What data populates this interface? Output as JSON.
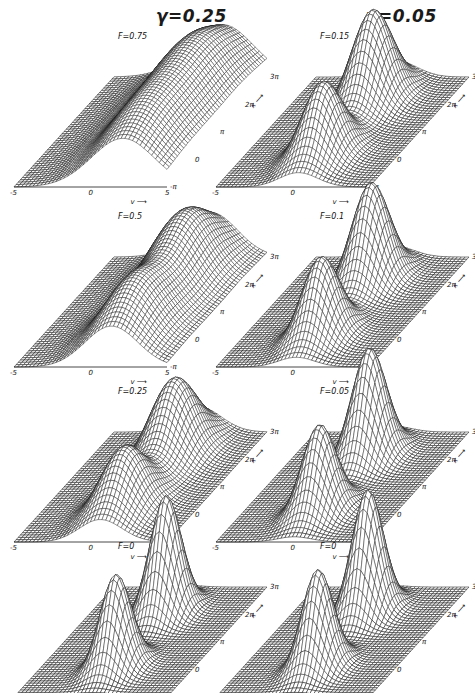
{
  "figure": {
    "columns": [
      {
        "title": "γ=0.25"
      },
      {
        "title": "γ=0.05"
      }
    ],
    "panels": [
      {
        "col": 0,
        "row": 0,
        "label": "F=0.75"
      },
      {
        "col": 1,
        "row": 0,
        "label": "F=0.15"
      },
      {
        "col": 0,
        "row": 1,
        "label": "F=0.5"
      },
      {
        "col": 1,
        "row": 1,
        "label": "F=0.1"
      },
      {
        "col": 0,
        "row": 2,
        "label": "F=0.25"
      },
      {
        "col": 1,
        "row": 2,
        "label": "F=0.05"
      },
      {
        "col": 0,
        "row": 3,
        "label": "F=0"
      },
      {
        "col": 1,
        "row": 3,
        "label": "F=0"
      }
    ],
    "axes": {
      "v_ticks": [
        "-5",
        "0",
        "5"
      ],
      "v_label": "v ⟶",
      "x_ticks": [
        "-π",
        "0",
        "π",
        "2π",
        "3π"
      ],
      "x_label": "x ⟶"
    }
  },
  "chart_data": {
    "type": "surface",
    "title": "",
    "layout": "4 rows × 2 columns of 3D wireframe surface plots",
    "columns": [
      "γ=0.25",
      "γ=0.05"
    ],
    "xlabel": "v",
    "ylabel": "x",
    "xlim": [
      -5,
      5
    ],
    "ylim": [
      "-π",
      "3π"
    ],
    "x_ticks": [
      "-5",
      "0",
      "5"
    ],
    "y_ticks": [
      "-π",
      "0",
      "π",
      "2π",
      "3π"
    ],
    "panels": [
      {
        "gamma": 0.25,
        "F": 0.75,
        "description": "broad diagonal ridge, nearly flat, shifted toward v>0"
      },
      {
        "gamma": 0.05,
        "F": 0.15,
        "description": "diagonal ridge with two moderate humps"
      },
      {
        "gamma": 0.25,
        "F": 0.5,
        "description": "wide undulating ridge with two shallow humps"
      },
      {
        "gamma": 0.05,
        "F": 0.1,
        "description": "two distinct peaks separated by 2π in x"
      },
      {
        "gamma": 0.25,
        "F": 0.25,
        "description": "two peaks along x, connected by low ridge"
      },
      {
        "gamma": 0.05,
        "F": 0.05,
        "description": "two tall peaks along x"
      },
      {
        "gamma": 0.25,
        "F": 0,
        "description": "two tall Gaussian-like peaks at v≈0, x=0 and x=2π"
      },
      {
        "gamma": 0.05,
        "F": 0,
        "description": "two tall Gaussian-like peaks at v≈0, x=0 and x=2π"
      }
    ],
    "grid": true,
    "legend": null
  },
  "style": {
    "line_color": "#1a1a1a",
    "background": "#ffffff"
  }
}
